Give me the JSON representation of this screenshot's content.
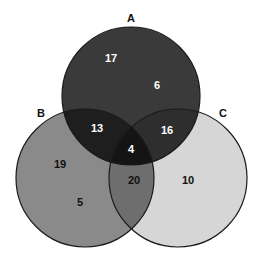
{
  "diagram": {
    "type": "venn",
    "sets": [
      {
        "id": "A",
        "label": "A",
        "fill": "#3a3a3a"
      },
      {
        "id": "B",
        "label": "B",
        "fill": "#8a8a8a"
      },
      {
        "id": "C",
        "label": "C",
        "fill": "#d6d6d6"
      }
    ],
    "regions": {
      "A_only_upper": "17",
      "A_only_lower": "6",
      "A_and_B": "13",
      "A_and_C": "16",
      "A_B_C": "4",
      "B_only_upper": "19",
      "B_only_lower": "5",
      "B_and_C": "20",
      "C_only": "10"
    },
    "colors": {
      "outline": "#1a1a1a",
      "A_fill": "#3a3a3a",
      "B_fill": "#8a8a8a",
      "C_fill": "#d6d6d6",
      "AB_fill": "#1e1e1e",
      "AC_fill": "#2e2e2e",
      "ABC_fill": "#141414",
      "BC_fill": "#6e6e6e",
      "light_text": "#ffffff",
      "dark_text": "#111111"
    }
  }
}
